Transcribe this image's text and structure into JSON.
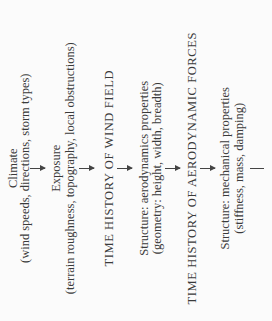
{
  "diagram": {
    "orientation": "rotated 90deg counter-clockwise, flow top-to-bottom",
    "nodes": [
      {
        "id": "climate",
        "title": "Climate",
        "detail": "(wind speeds, directions, storm types)"
      },
      {
        "id": "exposure",
        "title": "Exposure",
        "detail": "(terrain roughness, topography, local obstructions)"
      },
      {
        "id": "wind-field",
        "title": "TIME HISTORY OF WIND FIELD"
      },
      {
        "id": "aero-props",
        "title": "Structure: aerodynamics properties",
        "detail": "(geometry: height, width, breadth)"
      },
      {
        "id": "aero-forces",
        "title": "TIME HISTORY OF AERODYNAMIC FORCES"
      },
      {
        "id": "mech-props",
        "title": "Structure: mechanical properties",
        "detail": "(stiffness, mass, damping)"
      }
    ],
    "edges": [
      [
        "climate",
        "exposure"
      ],
      [
        "exposure",
        "wind-field"
      ],
      [
        "wind-field",
        "aero-props"
      ],
      [
        "aero-props",
        "aero-forces"
      ],
      [
        "aero-forces",
        "mech-props"
      ],
      [
        "mech-props",
        "(continues)"
      ]
    ]
  }
}
